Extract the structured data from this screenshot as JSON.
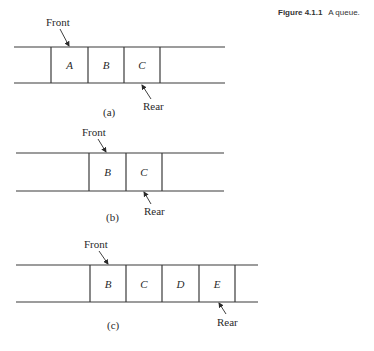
{
  "caption": {
    "number": "Figure 4.1.1",
    "text": "A queue."
  },
  "colors": {
    "line": "#3a3a3a",
    "text": "#2a2a2a",
    "background": "#ffffff"
  },
  "panels": [
    {
      "id": "a",
      "label": "(a)",
      "top_y": 47,
      "bottom_y": 83,
      "line_x1": 14,
      "line_x2": 225,
      "dividers": [
        51,
        88,
        124,
        160
      ],
      "cells": [
        "A",
        "B",
        "C"
      ],
      "front": {
        "label": "Front",
        "text_x": 46,
        "text_y": 26,
        "arrow": [
          60,
          29,
          69,
          46
        ]
      },
      "rear": {
        "label": "Rear",
        "text_x": 143,
        "text_y": 110,
        "arrow": [
          151,
          99,
          142,
          85
        ]
      },
      "label_x": 103,
      "label_y": 116
    },
    {
      "id": "b",
      "label": "(b)",
      "top_y": 153,
      "bottom_y": 191,
      "line_x1": 16,
      "line_x2": 224,
      "dividers": [
        89,
        126,
        162
      ],
      "cells": [
        "B",
        "C"
      ],
      "front": {
        "label": "Front",
        "text_x": 82,
        "text_y": 136,
        "arrow": [
          98,
          139,
          106,
          152
        ]
      },
      "rear": {
        "label": "Rear",
        "text_x": 144,
        "text_y": 215,
        "arrow": [
          151,
          204,
          144,
          192
        ]
      },
      "label_x": 106,
      "label_y": 221
    },
    {
      "id": "c",
      "label": "(c)",
      "top_y": 265,
      "bottom_y": 302,
      "line_x1": 16,
      "line_x2": 258,
      "dividers": [
        90,
        126,
        162,
        199,
        235
      ],
      "cells": [
        "B",
        "C",
        "D",
        "E"
      ],
      "front": {
        "label": "Front",
        "text_x": 84,
        "text_y": 248,
        "arrow": [
          99,
          251,
          108,
          264
        ]
      },
      "rear": {
        "label": "Rear",
        "text_x": 217,
        "text_y": 326,
        "arrow": [
          226,
          314,
          219,
          303
        ]
      },
      "label_x": 107,
      "label_y": 329
    }
  ]
}
